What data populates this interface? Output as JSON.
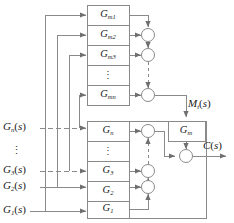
{
  "figure": {
    "type": "block-diagram",
    "stroke_color": "#8a8a8a",
    "text_color": "#1a1a1a",
    "background": "#ffffff"
  },
  "inputs": [
    {
      "name": "input-gn",
      "base": "G",
      "sub": "n",
      "arg": "(s)",
      "text": "Gn(s)"
    },
    {
      "name": "input-vdots",
      "text": "⋮"
    },
    {
      "name": "input-g3",
      "base": "G",
      "sub": "3",
      "arg": "(s)",
      "text": "G3(s)"
    },
    {
      "name": "input-g2",
      "base": "G",
      "sub": "2",
      "arg": "(s)",
      "text": "G2(s)"
    },
    {
      "name": "input-g1",
      "base": "G",
      "sub": "1",
      "arg": "(s)",
      "text": "G1(s)"
    }
  ],
  "top_blocks": [
    {
      "name": "block-gm1",
      "base": "G",
      "sub": "m1",
      "text": "Gm1"
    },
    {
      "name": "block-gm2",
      "base": "G",
      "sub": "m2",
      "text": "Gm2"
    },
    {
      "name": "block-gm3",
      "base": "G",
      "sub": "m3",
      "text": "Gm3"
    },
    {
      "name": "block-vdots-top",
      "text": "⋮"
    },
    {
      "name": "block-gmn",
      "base": "G",
      "sub": "mn",
      "text": "Gmn"
    }
  ],
  "bottom_blocks": [
    {
      "name": "block-gn",
      "base": "G",
      "sub": "n",
      "text": "Gn"
    },
    {
      "name": "block-vdots-bottom",
      "text": "⋮"
    },
    {
      "name": "block-g3",
      "base": "G",
      "sub": "3",
      "text": "G3"
    },
    {
      "name": "block-g2",
      "base": "G",
      "sub": "2",
      "text": "G2"
    },
    {
      "name": "block-g1",
      "base": "G",
      "sub": "1",
      "text": "G1"
    }
  ],
  "feedback_block": {
    "name": "block-gm-feedback",
    "base": "G",
    "sub": "m",
    "text": "Gm"
  },
  "signals": {
    "intermediate": {
      "name": "signal-mt",
      "base": "M",
      "sub": "t",
      "arg": "(s)",
      "text": "Mt(s)"
    },
    "output": {
      "name": "signal-cs",
      "base": "C",
      "sub": "",
      "arg": "(s)",
      "text": "C(s)"
    }
  },
  "summing_junctions": [
    {
      "name": "sum-top-1"
    },
    {
      "name": "sum-top-2"
    },
    {
      "name": "sum-top-n"
    },
    {
      "name": "sum-bottom-n"
    },
    {
      "name": "sum-bottom-3"
    },
    {
      "name": "sum-bottom-2"
    },
    {
      "name": "sum-output"
    }
  ]
}
